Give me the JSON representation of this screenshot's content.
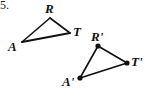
{
  "figure": {
    "problem_number": "5.",
    "background_color": "#ffffff",
    "stroke_color": "#111111",
    "vertex_dot_color": "#111111",
    "width": 145,
    "height": 102,
    "caption": "Triangle ART and its transformed image triangle A'R'T'"
  },
  "preimage_triangle": {
    "name": "triangle-ART",
    "has_vertex_dots": false,
    "vertices": [
      {
        "label": "A",
        "x": 22,
        "y": 42
      },
      {
        "label": "R",
        "x": 50,
        "y": 18
      },
      {
        "label": "T",
        "x": 70,
        "y": 33
      }
    ],
    "labels": [
      {
        "text": "A",
        "x": 8,
        "y": 40
      },
      {
        "text": "R",
        "x": 45,
        "y": 2
      },
      {
        "text": "T",
        "x": 73,
        "y": 25
      }
    ]
  },
  "image_triangle": {
    "name": "triangle-A-prime-R-prime-T-prime",
    "has_vertex_dots": true,
    "vertices": [
      {
        "label": "A'",
        "x": 80,
        "y": 78
      },
      {
        "label": "R'",
        "x": 98,
        "y": 46
      },
      {
        "label": "T'",
        "x": 127,
        "y": 63
      }
    ],
    "labels": [
      {
        "text": "A'",
        "x": 62,
        "y": 75
      },
      {
        "text": "R'",
        "x": 91,
        "y": 30
      },
      {
        "text": "T'",
        "x": 131,
        "y": 55
      }
    ]
  },
  "geometry_data": {
    "type": "diagram",
    "shape": "triangle-pair",
    "segments_preimage": [
      "AR",
      "RT",
      "TA"
    ],
    "segments_image": [
      "A'R'",
      "R'T'",
      "T'A'"
    ],
    "correspondence": [
      {
        "from": "A",
        "to": "A'"
      },
      {
        "from": "R",
        "to": "R'"
      },
      {
        "from": "T",
        "to": "T'"
      }
    ]
  }
}
